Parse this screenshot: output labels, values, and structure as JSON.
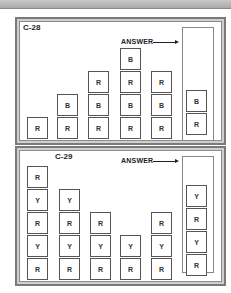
{
  "puzzles": [
    {
      "id": "C-28",
      "answer_label": "ANSWER",
      "columns": [
        [
          "R"
        ],
        [
          "R",
          "B"
        ],
        [
          "R",
          "B",
          "R"
        ],
        [
          "R",
          "B",
          "R",
          "B"
        ],
        [
          "R",
          "B",
          "R"
        ]
      ],
      "answer": [
        "R",
        "B"
      ]
    },
    {
      "id": "C-29",
      "answer_label": "ANSWER",
      "columns": [
        [
          "R",
          "Y",
          "R",
          "Y",
          "R"
        ],
        [
          "R",
          "Y",
          "R",
          "Y"
        ],
        [
          "R",
          "Y",
          "R"
        ],
        [
          "R",
          "Y"
        ],
        [
          "R",
          "Y",
          "R"
        ]
      ],
      "answer": [
        "R",
        "Y",
        "R",
        "Y"
      ]
    }
  ]
}
